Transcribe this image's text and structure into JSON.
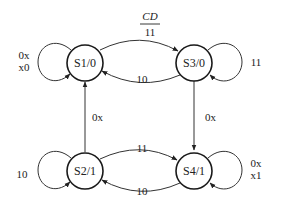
{
  "header": {
    "inputs_label": "CD",
    "outputs_label": "11"
  },
  "states": [
    {
      "id": "S1",
      "label": "S1/0",
      "output": "0"
    },
    {
      "id": "S3",
      "label": "S3/0",
      "output": "0"
    },
    {
      "id": "S2",
      "label": "S2/1",
      "output": "1"
    },
    {
      "id": "S4",
      "label": "S4/1",
      "output": "1"
    }
  ],
  "transitions": [
    {
      "from": "S1",
      "to": "S1",
      "label_lines": [
        "0x",
        "x0"
      ]
    },
    {
      "from": "S1",
      "to": "S3",
      "label_lines": [
        "11"
      ]
    },
    {
      "from": "S3",
      "to": "S1",
      "label_lines": [
        "10"
      ]
    },
    {
      "from": "S3",
      "to": "S3",
      "label_lines": [
        "11"
      ]
    },
    {
      "from": "S3",
      "to": "S4",
      "label_lines": [
        "0x"
      ]
    },
    {
      "from": "S2",
      "to": "S1",
      "label_lines": [
        "0x"
      ]
    },
    {
      "from": "S2",
      "to": "S2",
      "label_lines": [
        "10"
      ]
    },
    {
      "from": "S2",
      "to": "S4",
      "label_lines": [
        "11"
      ]
    },
    {
      "from": "S4",
      "to": "S2",
      "label_lines": [
        "10"
      ]
    },
    {
      "from": "S4",
      "to": "S4",
      "label_lines": [
        "0x",
        "x1"
      ]
    }
  ]
}
